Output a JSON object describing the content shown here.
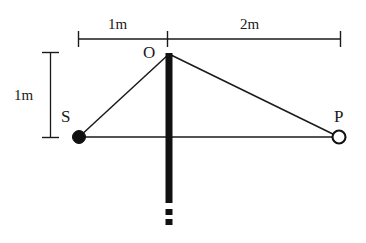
{
  "figure": {
    "background_color": "#ffffff",
    "line_color": "#1a1a1a",
    "width": 366,
    "height": 243
  },
  "dimensions": {
    "horizontal_left": {
      "label": "1m",
      "from_x": 78,
      "to_x": 167,
      "y": 39
    },
    "horizontal_right": {
      "label": "2m",
      "from_x": 167,
      "to_x": 341,
      "y": 39
    },
    "vertical_left": {
      "label": "1m",
      "x": 50,
      "from_y": 52,
      "to_y": 138
    }
  },
  "points": [
    {
      "id": "O",
      "label": "O",
      "x": 169,
      "y": 53,
      "style": "apex",
      "filled": false
    },
    {
      "id": "S",
      "label": "S",
      "x": 79,
      "y": 137,
      "style": "circle",
      "filled": true
    },
    {
      "id": "P",
      "label": "P",
      "x": 339,
      "y": 137,
      "style": "circle",
      "filled": false
    }
  ],
  "segments": [
    {
      "name": "S-to-O",
      "from": "S",
      "to": "O"
    },
    {
      "name": "O-to-P",
      "from": "O",
      "to": "P"
    },
    {
      "name": "S-to-P",
      "from": "S",
      "to": "P"
    }
  ],
  "mast": {
    "name": "vertical-mast",
    "x": 169,
    "top_y": 53,
    "solid_bottom_y": 203,
    "width": 7,
    "color": "#111111",
    "continuation_dashes": [
      {
        "top_y": 209,
        "bottom_y": 214
      },
      {
        "top_y": 219,
        "bottom_y": 224
      }
    ]
  }
}
